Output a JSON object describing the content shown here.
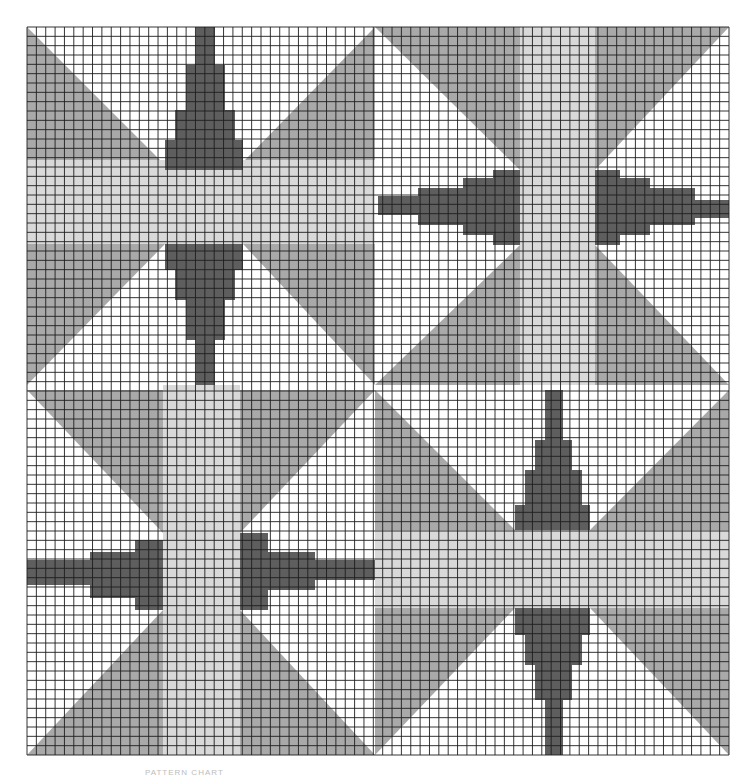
{
  "page": {
    "caption": "PATTERN CHART"
  },
  "colors": {
    "background": "#ffffff",
    "light": "#d9d9d9",
    "mid": "#a9a9a9",
    "dark": "#5e5e5e",
    "grid": "#1e1e1e"
  },
  "grid": {
    "x0": 27,
    "y0": 27,
    "x1": 729,
    "y1": 755,
    "cols": 75,
    "rows": 78
  },
  "quadrants": [
    {
      "name": "top-left-star",
      "box": [
        27,
        27,
        375,
        385
      ],
      "shapes": [
        {
          "fill": "mid",
          "points": [
            [
              27,
              27
            ],
            [
              160,
              160
            ],
            [
              27,
              160
            ]
          ]
        },
        {
          "fill": "mid",
          "points": [
            [
              375,
              27
            ],
            [
              245,
              160
            ],
            [
              375,
              160
            ]
          ]
        },
        {
          "fill": "mid",
          "points": [
            [
              27,
              385
            ],
            [
              27,
              244
            ],
            [
              165,
              244
            ]
          ]
        },
        {
          "fill": "mid",
          "points": [
            [
              375,
              385
            ],
            [
              375,
              244
            ],
            [
              243,
              244
            ]
          ]
        },
        {
          "fill": "light",
          "points": [
            [
              27,
              160
            ],
            [
              375,
              160
            ],
            [
              375,
              244
            ],
            [
              27,
              244
            ]
          ]
        },
        {
          "fill": "dark",
          "points": [
            [
              196,
              27
            ],
            [
              215,
              27
            ],
            [
              215,
              65
            ],
            [
              225,
              65
            ],
            [
              225,
              110
            ],
            [
              235,
              110
            ],
            [
              235,
              140
            ],
            [
              243,
              140
            ],
            [
              243,
              170
            ],
            [
              165,
              170
            ],
            [
              165,
              140
            ],
            [
              175,
              140
            ],
            [
              175,
              110
            ],
            [
              186,
              110
            ],
            [
              186,
              65
            ],
            [
              196,
              65
            ]
          ]
        },
        {
          "fill": "dark",
          "points": [
            [
              165,
              244
            ],
            [
              243,
              244
            ],
            [
              243,
              270
            ],
            [
              235,
              270
            ],
            [
              235,
              300
            ],
            [
              225,
              300
            ],
            [
              225,
              340
            ],
            [
              215,
              340
            ],
            [
              215,
              390
            ],
            [
              196,
              390
            ],
            [
              196,
              340
            ],
            [
              186,
              340
            ],
            [
              186,
              300
            ],
            [
              175,
              300
            ],
            [
              175,
              270
            ],
            [
              165,
              270
            ]
          ]
        }
      ]
    },
    {
      "name": "top-right-star",
      "box": [
        375,
        27,
        729,
        385
      ],
      "shapes": [
        {
          "fill": "mid",
          "points": [
            [
              375,
              27
            ],
            [
              520,
              27
            ],
            [
              520,
              170
            ]
          ]
        },
        {
          "fill": "mid",
          "points": [
            [
              729,
              27
            ],
            [
              595,
              27
            ],
            [
              595,
              170
            ]
          ]
        },
        {
          "fill": "mid",
          "points": [
            [
              375,
              385
            ],
            [
              520,
              385
            ],
            [
              520,
              245
            ]
          ]
        },
        {
          "fill": "mid",
          "points": [
            [
              729,
              385
            ],
            [
              595,
              385
            ],
            [
              595,
              245
            ]
          ]
        },
        {
          "fill": "light",
          "points": [
            [
              520,
              27
            ],
            [
              595,
              27
            ],
            [
              595,
              385
            ],
            [
              520,
              385
            ]
          ]
        },
        {
          "fill": "dark",
          "points": [
            [
              378,
              196
            ],
            [
              418,
              196
            ],
            [
              418,
              188
            ],
            [
              463,
              188
            ],
            [
              463,
              178
            ],
            [
              493,
              178
            ],
            [
              493,
              170
            ],
            [
              520,
              170
            ],
            [
              520,
              245
            ],
            [
              493,
              245
            ],
            [
              493,
              235
            ],
            [
              463,
              235
            ],
            [
              463,
              225
            ],
            [
              418,
              225
            ],
            [
              418,
              215
            ],
            [
              378,
              215
            ]
          ]
        },
        {
          "fill": "dark",
          "points": [
            [
              595,
              170
            ],
            [
              620,
              170
            ],
            [
              620,
              178
            ],
            [
              650,
              178
            ],
            [
              650,
              188
            ],
            [
              695,
              188
            ],
            [
              695,
              200
            ],
            [
              729,
              200
            ],
            [
              729,
              218
            ],
            [
              695,
              218
            ],
            [
              695,
              225
            ],
            [
              650,
              225
            ],
            [
              650,
              235
            ],
            [
              620,
              235
            ],
            [
              620,
              245
            ],
            [
              595,
              245
            ]
          ]
        }
      ]
    },
    {
      "name": "bottom-left-star",
      "box": [
        27,
        385,
        375,
        755
      ],
      "shapes": [
        {
          "fill": "mid",
          "points": [
            [
              27,
              390
            ],
            [
              163,
              390
            ],
            [
              163,
              533
            ]
          ]
        },
        {
          "fill": "mid",
          "points": [
            [
              375,
              390
            ],
            [
              240,
              390
            ],
            [
              240,
              533
            ]
          ]
        },
        {
          "fill": "mid",
          "points": [
            [
              27,
              755
            ],
            [
              163,
              755
            ],
            [
              163,
              610
            ]
          ]
        },
        {
          "fill": "mid",
          "points": [
            [
              375,
              755
            ],
            [
              240,
              755
            ],
            [
              240,
              610
            ]
          ]
        },
        {
          "fill": "light",
          "points": [
            [
              163,
              385
            ],
            [
              240,
              385
            ],
            [
              240,
              755
            ],
            [
              163,
              755
            ]
          ]
        },
        {
          "fill": "dark",
          "points": [
            [
              27,
              560
            ],
            [
              90,
              560
            ],
            [
              90,
              552
            ],
            [
              135,
              552
            ],
            [
              135,
              540
            ],
            [
              163,
              540
            ],
            [
              163,
              610
            ],
            [
              135,
              610
            ],
            [
              135,
              598
            ],
            [
              90,
              598
            ],
            [
              90,
              585
            ],
            [
              27,
              585
            ]
          ]
        },
        {
          "fill": "dark",
          "points": [
            [
              240,
              533
            ],
            [
              268,
              533
            ],
            [
              268,
              552
            ],
            [
              315,
              552
            ],
            [
              315,
              560
            ],
            [
              375,
              560
            ],
            [
              375,
              580
            ],
            [
              315,
              580
            ],
            [
              315,
              590
            ],
            [
              268,
              590
            ],
            [
              268,
              610
            ],
            [
              240,
              610
            ]
          ]
        }
      ]
    },
    {
      "name": "bottom-right-star",
      "box": [
        375,
        385,
        729,
        755
      ],
      "shapes": [
        {
          "fill": "mid",
          "points": [
            [
              375,
              390
            ],
            [
              515,
              530
            ],
            [
              375,
              530
            ]
          ]
        },
        {
          "fill": "mid",
          "points": [
            [
              729,
              390
            ],
            [
              590,
              530
            ],
            [
              729,
              530
            ]
          ]
        },
        {
          "fill": "mid",
          "points": [
            [
              375,
              755
            ],
            [
              375,
              608
            ],
            [
              515,
              608
            ]
          ]
        },
        {
          "fill": "mid",
          "points": [
            [
              729,
              755
            ],
            [
              729,
              608
            ],
            [
              590,
              608
            ]
          ]
        },
        {
          "fill": "light",
          "points": [
            [
              375,
              530
            ],
            [
              729,
              530
            ],
            [
              729,
              608
            ],
            [
              375,
              608
            ]
          ]
        },
        {
          "fill": "dark",
          "points": [
            [
              545,
              390
            ],
            [
              563,
              390
            ],
            [
              563,
              440
            ],
            [
              572,
              440
            ],
            [
              572,
              470
            ],
            [
              582,
              470
            ],
            [
              582,
              505
            ],
            [
              590,
              505
            ],
            [
              590,
              530
            ],
            [
              515,
              530
            ],
            [
              515,
              505
            ],
            [
              525,
              505
            ],
            [
              525,
              470
            ],
            [
              535,
              470
            ],
            [
              535,
              440
            ],
            [
              545,
              440
            ]
          ]
        },
        {
          "fill": "dark",
          "points": [
            [
              515,
              608
            ],
            [
              590,
              608
            ],
            [
              590,
              635
            ],
            [
              582,
              635
            ],
            [
              582,
              665
            ],
            [
              572,
              665
            ],
            [
              572,
              700
            ],
            [
              563,
              700
            ],
            [
              563,
              755
            ],
            [
              545,
              755
            ],
            [
              545,
              700
            ],
            [
              535,
              700
            ],
            [
              535,
              665
            ],
            [
              525,
              665
            ],
            [
              525,
              635
            ],
            [
              515,
              635
            ]
          ]
        }
      ]
    }
  ]
}
